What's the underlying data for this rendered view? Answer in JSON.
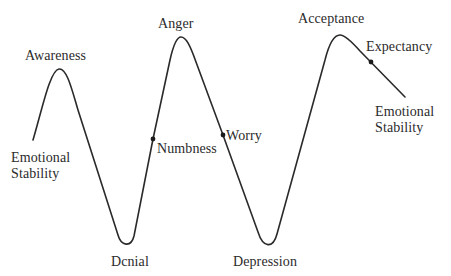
{
  "diagram": {
    "title": "",
    "curve": {
      "stroke_color": "#2a2a2a",
      "marker_color": "#1a1a1a"
    },
    "stages": [
      {
        "id": "emotional-stability-start",
        "label": "Emotional Stability",
        "kind": "start"
      },
      {
        "id": "awareness",
        "label": "Awareness",
        "kind": "peak"
      },
      {
        "id": "denial",
        "label": "Dcnial",
        "kind": "trough"
      },
      {
        "id": "numbness",
        "label": "Numbness",
        "kind": "point"
      },
      {
        "id": "anger",
        "label": "Anger",
        "kind": "peak"
      },
      {
        "id": "worry",
        "label": "Worry",
        "kind": "point"
      },
      {
        "id": "depression",
        "label": "Depression",
        "kind": "trough"
      },
      {
        "id": "acceptance",
        "label": "Acceptance",
        "kind": "peak"
      },
      {
        "id": "expectancy",
        "label": "Expectancy",
        "kind": "point"
      },
      {
        "id": "emotional-stability-end",
        "label": "Emotional Stability",
        "kind": "end"
      }
    ],
    "labels": {
      "awareness": "Awareness",
      "anger": "Anger",
      "acceptance": "Acceptance",
      "expectancy": "Expectancy",
      "emotional_stability_left_1": "Emotional",
      "emotional_stability_left_2": "Stability",
      "numbness": "Numbness",
      "worry": "Worry",
      "emotional_stability_right_1": "Emotional",
      "emotional_stability_right_2": "Stability",
      "denial": "Dcnial",
      "depression": "Depression"
    }
  }
}
